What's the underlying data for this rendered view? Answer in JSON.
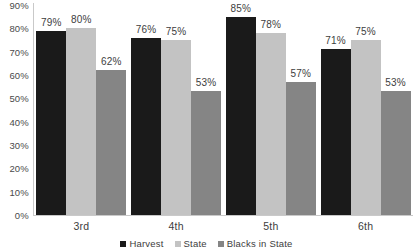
{
  "title_remnant": "g",
  "chart_data": {
    "type": "bar",
    "title": "",
    "xlabel": "",
    "ylabel": "",
    "ylim": [
      0,
      90
    ],
    "grid": false,
    "legend_position": "bottom",
    "categories": [
      "3rd",
      "4th",
      "5th",
      "6th"
    ],
    "y_ticks": [
      "0%",
      "10%",
      "20%",
      "30%",
      "40%",
      "50%",
      "60%",
      "70%",
      "80%",
      "90%"
    ],
    "y_tick_values": [
      0,
      10,
      20,
      30,
      40,
      50,
      60,
      70,
      80,
      90
    ],
    "series": [
      {
        "name": "Harvest",
        "color": "#1a1a1a",
        "values": [
          79,
          76,
          85,
          71
        ],
        "labels": [
          "79%",
          "76%",
          "85%",
          "71%"
        ]
      },
      {
        "name": "State",
        "color": "#c3c3c3",
        "values": [
          80,
          75,
          78,
          75
        ],
        "labels": [
          "80%",
          "75%",
          "78%",
          "75%"
        ]
      },
      {
        "name": "Blacks in State",
        "color": "#858585",
        "values": [
          62,
          53,
          57,
          53
        ],
        "labels": [
          "62%",
          "53%",
          "57%",
          "53%"
        ]
      }
    ]
  }
}
